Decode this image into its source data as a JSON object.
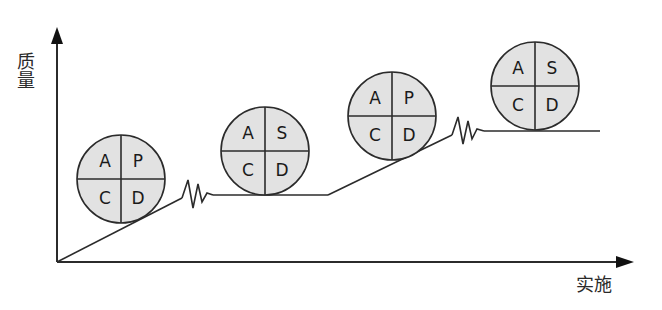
{
  "diagram": {
    "axes": {
      "y_label": "质量",
      "x_label": "实施"
    },
    "colors": {
      "line": "#2b2b2b",
      "circle_fill": "#e2e2e2",
      "background": "#ffffff"
    },
    "cycles": [
      {
        "id": 1,
        "quadrants": {
          "top_left": "A",
          "top_right": "P",
          "bottom_left": "C",
          "bottom_right": "D"
        }
      },
      {
        "id": 2,
        "quadrants": {
          "top_left": "A",
          "top_right": "S",
          "bottom_left": "C",
          "bottom_right": "D"
        }
      },
      {
        "id": 3,
        "quadrants": {
          "top_left": "A",
          "top_right": "P",
          "bottom_left": "C",
          "bottom_right": "D"
        }
      },
      {
        "id": 4,
        "quadrants": {
          "top_left": "A",
          "top_right": "S",
          "bottom_left": "C",
          "bottom_right": "D"
        }
      }
    ]
  }
}
